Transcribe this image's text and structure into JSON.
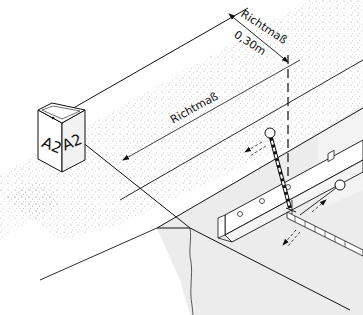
{
  "diagram": {
    "type": "technical-isometric-drawing",
    "labels": {
      "offset_label": "Richtmaß",
      "offset_value": "0,30m",
      "long_dimension_label": "Richtmaß",
      "marker_face_left": "A2",
      "marker_face_right": "A2"
    },
    "components": [
      {
        "name": "survey-marker-block",
        "text": "A2"
      },
      {
        "name": "ground-surface-stippled"
      },
      {
        "name": "excavation-pit"
      },
      {
        "name": "angle-profile-rail"
      },
      {
        "name": "plumb-rod"
      },
      {
        "name": "measuring-tape"
      },
      {
        "name": "dashed-vertical-reference-line"
      }
    ],
    "colors": {
      "line": "#111111",
      "stipple": "#8a8a8a",
      "pit_wall": "#ececec",
      "background": "#ffffff"
    }
  }
}
